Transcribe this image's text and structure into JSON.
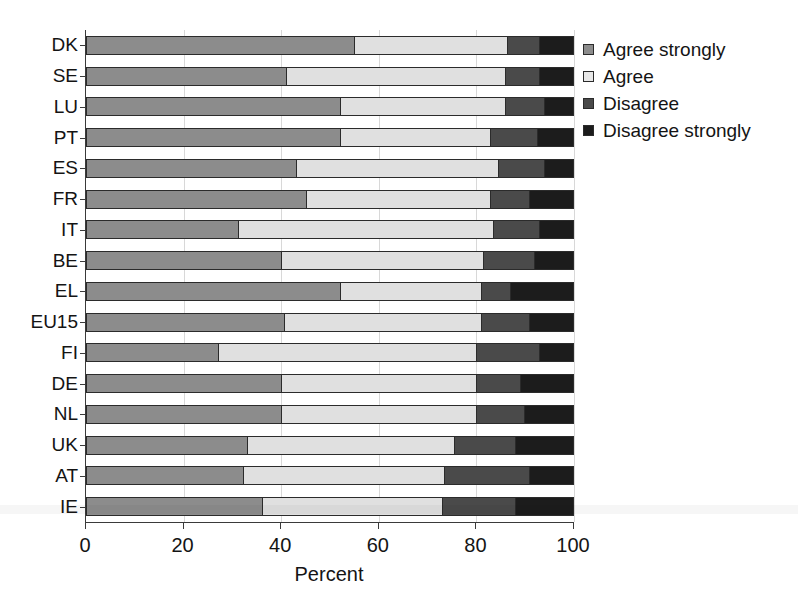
{
  "chart_data": {
    "type": "bar",
    "subtype": "stacked-horizontal-100pct",
    "title": "",
    "xlabel": "Percent",
    "ylabel": "",
    "xlim": [
      0,
      100
    ],
    "xticks": [
      0,
      20,
      40,
      60,
      80,
      100
    ],
    "xtick_labels": [
      "0",
      "20",
      "40",
      "60",
      "80",
      "100"
    ],
    "grid": "vertical",
    "legend_position": "right",
    "orientation": "horizontal",
    "categories": [
      "DK",
      "SE",
      "LU",
      "PT",
      "ES",
      "FR",
      "IT",
      "BE",
      "EL",
      "EU15",
      "FI",
      "DE",
      "NL",
      "UK",
      "AT",
      "IE"
    ],
    "series": [
      {
        "name": "Agree strongly",
        "color": "#8c8c8c",
        "values": [
          55,
          41,
          52,
          52,
          43,
          45,
          31,
          40,
          52,
          40.5,
          27,
          40,
          40,
          33,
          32,
          36
        ]
      },
      {
        "name": "Agree",
        "color": "#e0e0e0",
        "values": [
          31.5,
          45,
          34,
          31,
          41.5,
          38,
          52.5,
          41.5,
          29,
          40.5,
          53,
          40,
          40,
          42.5,
          41.5,
          37
        ]
      },
      {
        "name": "Disagree",
        "color": "#4a4a4a",
        "values": [
          6.5,
          7,
          8,
          9.5,
          9.5,
          8,
          9.5,
          10.5,
          6,
          10,
          13,
          9,
          10,
          12.5,
          17.5,
          15
        ]
      },
      {
        "name": "Disagree strongly",
        "color": "#1c1c1c",
        "values": [
          7,
          7,
          6,
          7.5,
          6,
          9,
          7,
          8,
          13,
          9,
          7,
          11,
          10,
          12,
          9,
          12
        ]
      }
    ]
  },
  "legend": {
    "items": [
      {
        "label": "Agree strongly",
        "color": "#8c8c8c"
      },
      {
        "label": "Agree",
        "color": "#e8e8e8"
      },
      {
        "label": "Disagree",
        "color": "#4a4a4a"
      },
      {
        "label": "Disagree strongly",
        "color": "#1c1c1c"
      }
    ]
  },
  "axis": {
    "x_title": "Percent",
    "x_tick_labels": [
      "0",
      "20",
      "40",
      "60",
      "80",
      "100"
    ],
    "y_tick_labels": [
      "DK",
      "SE",
      "LU",
      "PT",
      "ES",
      "FR",
      "IT",
      "BE",
      "EL",
      "EU15",
      "FI",
      "DE",
      "NL",
      "UK",
      "AT",
      "IE"
    ]
  }
}
